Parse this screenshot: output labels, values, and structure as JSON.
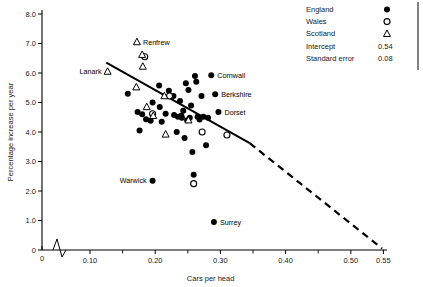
{
  "chart_data": {
    "type": "scatter",
    "title": "",
    "xlabel": "Cars per head",
    "ylabel": "Percentage increase per year",
    "xlim": [
      0.07,
      0.55
    ],
    "ylim": [
      0,
      8.0
    ],
    "xticks": [
      "0",
      "0.10",
      "0.20",
      "0.30",
      "0.40",
      "0.50",
      "0.55"
    ],
    "xtick_values": [
      0,
      0.1,
      0.2,
      0.3,
      0.4,
      0.5,
      0.55
    ],
    "yticks": [
      "0",
      "1.0",
      "2.0",
      "3.0",
      "4.0",
      "5.0",
      "6.0",
      "7.0",
      "8.0"
    ],
    "ytick_values": [
      0,
      1.0,
      2.0,
      3.0,
      4.0,
      5.0,
      6.0,
      7.0,
      8.0
    ],
    "grid": false,
    "axis_break_x": true,
    "legend_position": "top-right",
    "legend_entries": [
      {
        "label": "England",
        "marker": "filled-circle"
      },
      {
        "label": "Wales",
        "marker": "open-circle"
      },
      {
        "label": "Scotland",
        "marker": "open-triangle"
      }
    ],
    "stats": [
      {
        "label": "Intercept",
        "value": "0.54"
      },
      {
        "label": "Standard error",
        "value": "0.08"
      }
    ],
    "fit_line": {
      "style": "solid-then-dashed",
      "x_start": 0.125,
      "y_start": 6.35,
      "x_solid_end": 0.345,
      "y_solid_end": 3.62,
      "x_end": 0.548,
      "y_end": 0.05
    },
    "series": [
      {
        "name": "England",
        "marker": "filled-circle",
        "points": [
          [
            0.158,
            5.3
          ],
          [
            0.173,
            4.68
          ],
          [
            0.18,
            4.6
          ],
          [
            0.176,
            4.05
          ],
          [
            0.186,
            4.43
          ],
          [
            0.193,
            4.38
          ],
          [
            0.196,
            5.0
          ],
          [
            0.206,
            5.58
          ],
          [
            0.207,
            4.85
          ],
          [
            0.21,
            4.35
          ],
          [
            0.216,
            4.62
          ],
          [
            0.221,
            5.4
          ],
          [
            0.228,
            5.22
          ],
          [
            0.229,
            4.58
          ],
          [
            0.233,
            4.0
          ],
          [
            0.235,
            4.52
          ],
          [
            0.238,
            5.05
          ],
          [
            0.24,
            4.55
          ],
          [
            0.241,
            4.48
          ],
          [
            0.243,
            4.72
          ],
          [
            0.245,
            3.8
          ],
          [
            0.247,
            5.65
          ],
          [
            0.249,
            4.4
          ],
          [
            0.251,
            5.42
          ],
          [
            0.253,
            4.48
          ],
          [
            0.255,
            4.9
          ],
          [
            0.257,
            3.32
          ],
          [
            0.259,
            2.55
          ],
          [
            0.261,
            5.9
          ],
          [
            0.263,
            5.7
          ],
          [
            0.265,
            4.52
          ],
          [
            0.268,
            4.42
          ],
          [
            0.271,
            5.22
          ],
          [
            0.274,
            4.52
          ],
          [
            0.278,
            3.55
          ],
          [
            0.281,
            4.48
          ],
          [
            0.286,
            5.92
          ],
          [
            0.292,
            5.28
          ],
          [
            0.297,
            4.68
          ],
          [
            0.196,
            2.35
          ],
          [
            0.29,
            0.95
          ]
        ]
      },
      {
        "name": "Wales",
        "marker": "open-circle",
        "points": [
          [
            0.184,
            6.55
          ],
          [
            0.196,
            4.62
          ],
          [
            0.222,
            5.22
          ],
          [
            0.259,
            2.25
          ],
          [
            0.272,
            4.0
          ],
          [
            0.31,
            3.9
          ]
        ]
      },
      {
        "name": "Scotland",
        "marker": "open-triangle",
        "points": [
          [
            0.172,
            7.05
          ],
          [
            0.18,
            6.62
          ],
          [
            0.181,
            6.22
          ],
          [
            0.127,
            6.05
          ],
          [
            0.171,
            5.52
          ],
          [
            0.187,
            4.85
          ],
          [
            0.197,
            4.55
          ],
          [
            0.214,
            5.22
          ],
          [
            0.216,
            3.92
          ],
          [
            0.251,
            4.4
          ]
        ]
      }
    ],
    "annotations": [
      {
        "text": "Renfrew",
        "point": [
          0.172,
          7.05
        ],
        "anchor": "left"
      },
      {
        "text": "Lanark",
        "point": [
          0.127,
          6.05
        ],
        "anchor": "right"
      },
      {
        "text": "Cornwall",
        "point": [
          0.286,
          5.92
        ],
        "anchor": "left"
      },
      {
        "text": "Berkshire",
        "point": [
          0.292,
          5.28
        ],
        "anchor": "left"
      },
      {
        "text": "Dorset",
        "point": [
          0.297,
          4.68
        ],
        "anchor": "left"
      },
      {
        "text": "Warwick",
        "point": [
          0.196,
          2.35
        ],
        "anchor": "right"
      },
      {
        "text": "Surrey",
        "point": [
          0.29,
          0.95
        ],
        "anchor": "left"
      }
    ]
  }
}
